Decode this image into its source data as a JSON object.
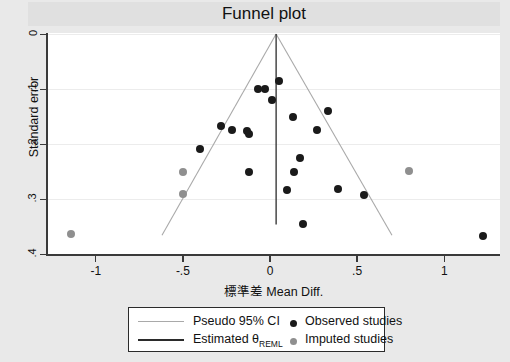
{
  "chart_data": {
    "type": "scatter",
    "title": "Funnel plot",
    "xlabel": "標準差 Mean Diff.",
    "ylabel": "Standard error",
    "xlim": [
      -1.28,
      1.32
    ],
    "ylim": [
      0,
      0.41
    ],
    "y_inverted": true,
    "grid": "horizontal-light",
    "legend_position": "below-axis",
    "xticks": [
      "-1",
      "-.5",
      "0",
      ".5",
      "1"
    ],
    "xtick_values": [
      -1,
      -0.5,
      0,
      0.5,
      1
    ],
    "yticks": [
      "0",
      ".1",
      ".2",
      ".3",
      ".4"
    ],
    "ytick_values": [
      0,
      0.1,
      0.2,
      0.3,
      0.4
    ],
    "estimated_theta": 0.035,
    "pseudo_ci_apex": {
      "x": 0.035,
      "y": 0.0
    },
    "pseudo_ci_left_base": {
      "x": -0.62,
      "y": 0.375
    },
    "pseudo_ci_right_base": {
      "x": 0.7,
      "y": 0.375
    },
    "series": [
      {
        "name": "Observed studies",
        "color": "#1a1a1a",
        "points": [
          {
            "x": 0.05,
            "y": 0.088
          },
          {
            "x": -0.07,
            "y": 0.103
          },
          {
            "x": -0.03,
            "y": 0.103
          },
          {
            "x": 0.01,
            "y": 0.123
          },
          {
            "x": 0.13,
            "y": 0.155
          },
          {
            "x": 0.33,
            "y": 0.143
          },
          {
            "x": -0.28,
            "y": 0.172
          },
          {
            "x": -0.22,
            "y": 0.178
          },
          {
            "x": -0.13,
            "y": 0.181
          },
          {
            "x": -0.12,
            "y": 0.186
          },
          {
            "x": 0.27,
            "y": 0.178
          },
          {
            "x": -0.4,
            "y": 0.215
          },
          {
            "x": 0.17,
            "y": 0.232
          },
          {
            "x": -0.12,
            "y": 0.257
          },
          {
            "x": 0.14,
            "y": 0.257
          },
          {
            "x": 0.1,
            "y": 0.29
          },
          {
            "x": 0.39,
            "y": 0.288
          },
          {
            "x": 0.54,
            "y": 0.3
          },
          {
            "x": 0.19,
            "y": 0.355
          },
          {
            "x": 1.22,
            "y": 0.376
          }
        ]
      },
      {
        "name": "Imputed studies",
        "color": "#8f8f8f",
        "points": [
          {
            "x": -0.5,
            "y": 0.258
          },
          {
            "x": -0.5,
            "y": 0.298
          },
          {
            "x": -1.14,
            "y": 0.372
          },
          {
            "x": 0.8,
            "y": 0.255
          }
        ]
      }
    ]
  },
  "legend": {
    "pseudo_ci_label": "Pseudo 95% CI",
    "estimated_label_prefix": "Estimated ",
    "estimated_label_theta": "θ",
    "estimated_label_sub": "REML",
    "observed_label": "Observed studies",
    "imputed_label": "Imputed studies"
  },
  "colors": {
    "background": "#e9e9e9",
    "title_band": "#e0e0e0",
    "plot_background": "#ffffff",
    "axis": "#3a3a3a",
    "gridline": "#ececec",
    "ci_line": "#a9a9a9",
    "reml_line": "#2b2b2b",
    "observed_dot": "#1a1a1a",
    "imputed_dot": "#8f8f8f"
  }
}
